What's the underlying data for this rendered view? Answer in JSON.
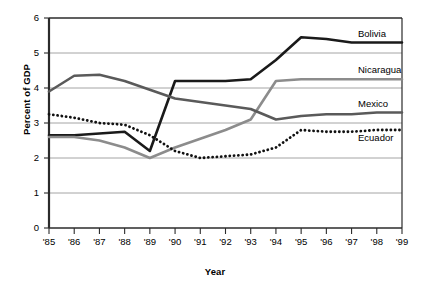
{
  "chart_data": {
    "type": "line",
    "title": "",
    "xlabel": "Year",
    "ylabel": "Percent of GDP",
    "x": [
      "'85",
      "'86",
      "'87",
      "'88",
      "'89",
      "'90",
      "'91",
      "'92",
      "'93",
      "'94",
      "'95",
      "'96",
      "'97",
      "'98",
      "'99"
    ],
    "x_values": [
      1985,
      1986,
      1987,
      1988,
      1989,
      1990,
      1991,
      1992,
      1993,
      1994,
      1995,
      1996,
      1997,
      1998,
      1999
    ],
    "ylim": [
      0,
      6
    ],
    "xlim": [
      "'85",
      "'99"
    ],
    "yticks": [
      0,
      1,
      2,
      3,
      4,
      5,
      6
    ],
    "grid": true,
    "legend_position": "right-inline",
    "series": [
      {
        "name": "Bolivia",
        "color": "#1a1a1a",
        "style": "solid-thick",
        "values": [
          2.65,
          2.65,
          2.7,
          2.75,
          2.2,
          4.2,
          4.2,
          4.2,
          4.25,
          4.8,
          5.45,
          5.4,
          5.3,
          5.3,
          5.3
        ]
      },
      {
        "name": "Nicaragua",
        "color": "#8c8c8c",
        "style": "solid-thick",
        "values": [
          2.6,
          2.6,
          2.5,
          2.3,
          2.0,
          2.3,
          2.55,
          2.8,
          3.1,
          4.2,
          4.25,
          4.25,
          4.25,
          4.25,
          4.25
        ]
      },
      {
        "name": "Mexico",
        "color": "#5a5a5a",
        "style": "solid-thick",
        "values": [
          3.9,
          4.35,
          4.38,
          4.2,
          3.95,
          3.7,
          3.6,
          3.5,
          3.4,
          3.1,
          3.2,
          3.25,
          3.25,
          3.3,
          3.3
        ]
      },
      {
        "name": "Ecuador",
        "color": "#111111",
        "style": "dotted-thick",
        "values": [
          3.25,
          3.15,
          3.0,
          2.95,
          2.65,
          2.2,
          2.0,
          2.05,
          2.1,
          2.3,
          2.8,
          2.75,
          2.75,
          2.8,
          2.8
        ]
      }
    ],
    "annotations": []
  },
  "axes": {
    "y_label": "Percent of GDP",
    "x_label": "Year",
    "y_ticks": [
      "0",
      "1",
      "2",
      "3",
      "4",
      "5",
      "6"
    ],
    "x_ticks": [
      "'85",
      "'86",
      "'87",
      "'88",
      "'89",
      "'90",
      "'91",
      "'92",
      "'93",
      "'94",
      "'95",
      "'96",
      "'97",
      "'98",
      "'99"
    ]
  },
  "legend": {
    "items": [
      {
        "label": "Bolivia"
      },
      {
        "label": "Nicaragua"
      },
      {
        "label": "Mexico"
      },
      {
        "label": "Ecuador"
      }
    ]
  }
}
